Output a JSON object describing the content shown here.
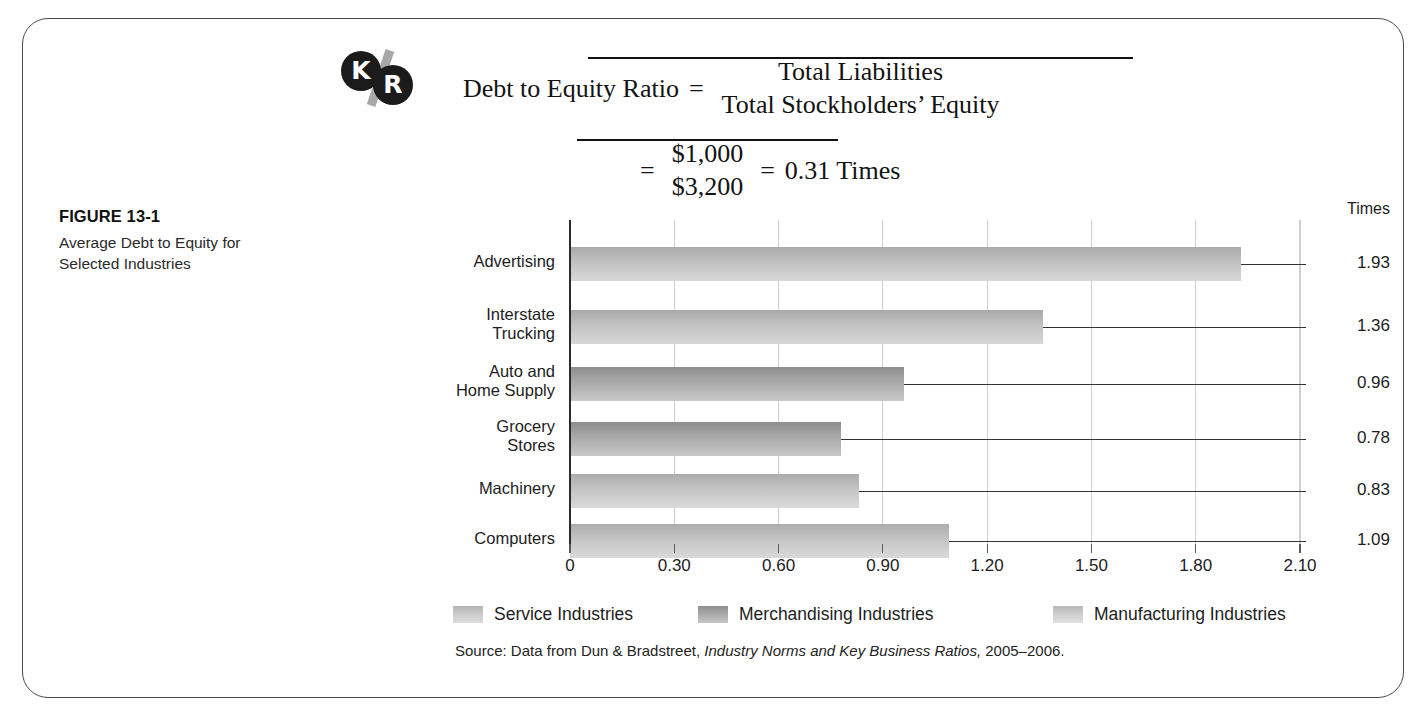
{
  "figure": {
    "number": "FIGURE 13-1",
    "title": "Average Debt to Equity for Selected Industries"
  },
  "logo": {
    "left_letter": "K",
    "right_letter": "R",
    "separator": "/"
  },
  "formula": {
    "label": "Debt to Equity Ratio",
    "equals": "=",
    "numerator": "Total Liabilities",
    "denominator": "Total Stockholders’ Equity",
    "equals2": "=",
    "value_numerator": "$1,000",
    "value_denominator": "$3,200",
    "equals3": "=",
    "result": "0.31 Times"
  },
  "chart_data": {
    "type": "bar",
    "orientation": "horizontal",
    "title": "Average Debt to Equity for Selected Industries",
    "xlabel": "",
    "ylabel": "",
    "unit_label": "Times",
    "xlim": [
      0,
      2.1
    ],
    "grid": true,
    "legend_position": "bottom",
    "categories": [
      "Advertising",
      "Interstate Trucking",
      "Auto and Home Supply",
      "Grocery Stores",
      "Machinery",
      "Computers"
    ],
    "category_lines": [
      [
        "Advertising"
      ],
      [
        "Interstate",
        "Trucking"
      ],
      [
        "Auto and",
        "Home Supply"
      ],
      [
        "Grocery",
        "Stores"
      ],
      [
        "Machinery"
      ],
      [
        "Computers"
      ]
    ],
    "values": [
      1.93,
      1.36,
      0.96,
      0.78,
      0.83,
      1.09
    ],
    "value_labels": [
      "1.93",
      "1.36",
      "0.96",
      "0.78",
      "0.83",
      "1.09"
    ],
    "groups": [
      "service",
      "service",
      "merch",
      "merch",
      "manuf",
      "manuf"
    ],
    "xticks": [
      0,
      0.3,
      0.6,
      0.9,
      1.2,
      1.5,
      1.8,
      2.1
    ],
    "xtick_labels": [
      "0",
      "0.30",
      "0.60",
      "0.90",
      "1.20",
      "1.50",
      "1.80",
      "2.10"
    ],
    "legend": [
      {
        "key": "service",
        "label": "Service Industries",
        "color": "#c6c6c6"
      },
      {
        "key": "merch",
        "label": "Merchandising Industries",
        "color": "#a8a8a8"
      },
      {
        "key": "manuf",
        "label": "Manufacturing Industries",
        "color": "#cfcfcf"
      }
    ]
  },
  "source": {
    "prefix": "Source: Data from Dun & Bradstreet, ",
    "italic": "Industry Norms and Key Business Ratios,",
    "suffix": " 2005–2006."
  }
}
